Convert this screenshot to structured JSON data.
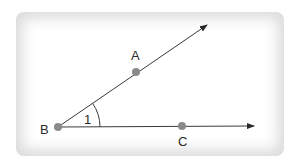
{
  "figure": {
    "points": {
      "A": {
        "label": "A",
        "x": 136,
        "y": 72
      },
      "B": {
        "label": "B",
        "x": 58,
        "y": 127
      },
      "C": {
        "label": "C",
        "x": 182,
        "y": 126
      }
    },
    "angle_label": "1",
    "rays": [
      {
        "name": "ray-BA",
        "from": "B",
        "through": "A",
        "arrow": true
      },
      {
        "name": "ray-BC",
        "from": "B",
        "through": "C",
        "arrow": true
      }
    ],
    "colors": {
      "line": "#3a3a3a",
      "point": "#8a8a8a",
      "label": "#2a2a2a",
      "card_edge": "#c8c8c8"
    }
  }
}
